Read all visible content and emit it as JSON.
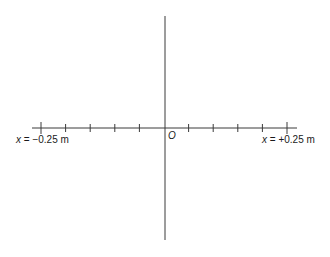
{
  "diagram": {
    "type": "number-line-axes",
    "origin_label": "O",
    "left_endpoint": {
      "variable": "x",
      "equals": " = ",
      "value": "−0.25",
      "unit": " m"
    },
    "right_endpoint": {
      "variable": "x",
      "equals": " = ",
      "value": "+0.25",
      "unit": " m"
    },
    "x_range_m": [
      -0.25,
      0.25
    ],
    "tick_spacing_m": 0.05,
    "ticks_m": [
      -0.25,
      -0.2,
      -0.15,
      -0.1,
      -0.05,
      0,
      0.05,
      0.1,
      0.15,
      0.2,
      0.25
    ],
    "line_color": "#3a3a3a"
  }
}
